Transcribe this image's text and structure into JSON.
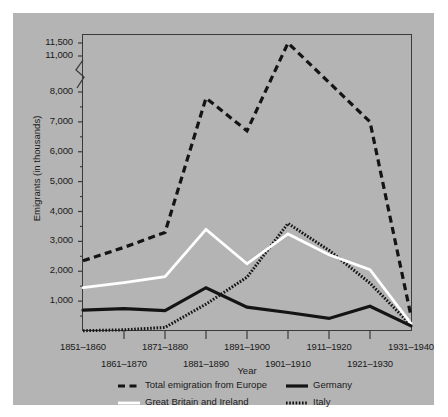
{
  "chart_data": {
    "type": "line",
    "title": "",
    "xlabel": "Year",
    "ylabel": "Emigrants (in thousands)",
    "categories": [
      "1851–1860",
      "1861–1870",
      "1871–1880",
      "1881–1890",
      "1891–1900",
      "1901–1910",
      "1911–1920",
      "1921–1930",
      "1931–1940"
    ],
    "ytick_labels": [
      "11,500",
      "11,000",
      "8,000",
      "7,000",
      "6,000",
      "5,000",
      "4,000",
      "3,000",
      "2,000",
      "1,000"
    ],
    "ytick_values": [
      11500,
      11000,
      8000,
      7000,
      6000,
      5000,
      4000,
      3000,
      2000,
      1000
    ],
    "ylim": [
      0,
      11500
    ],
    "axis_break": {
      "between": [
        8000,
        11000
      ],
      "style": "zigzag"
    },
    "grid": false,
    "legend_position": "below",
    "series": [
      {
        "name": "Total emigration from Europe",
        "style": "dashed",
        "color": "#141414",
        "values": [
          2350,
          2800,
          3300,
          7800,
          6700,
          11500,
          8800,
          7000,
          500
        ]
      },
      {
        "name": "Great Britain and Ireland",
        "style": "solid",
        "color": "#ffffff",
        "values": [
          1450,
          1620,
          1820,
          3400,
          2250,
          3250,
          2550,
          2050,
          250
        ]
      },
      {
        "name": "Germany",
        "style": "solid-thick",
        "color": "#141414",
        "values": [
          700,
          750,
          680,
          1450,
          800,
          620,
          420,
          830,
          170
        ]
      },
      {
        "name": "Italy",
        "style": "dotted",
        "color": "#141414",
        "values": [
          10,
          40,
          120,
          900,
          1800,
          3600,
          2700,
          1600,
          200
        ]
      }
    ]
  },
  "legend": {
    "items": [
      {
        "label": "Total emigration from Europe",
        "icon": "dashed-line-swatch"
      },
      {
        "label": "Germany",
        "icon": "solid-line-swatch"
      },
      {
        "label": "Great Britain and Ireland",
        "icon": "white-line-swatch"
      },
      {
        "label": "Italy",
        "icon": "dotted-line-swatch"
      }
    ]
  }
}
